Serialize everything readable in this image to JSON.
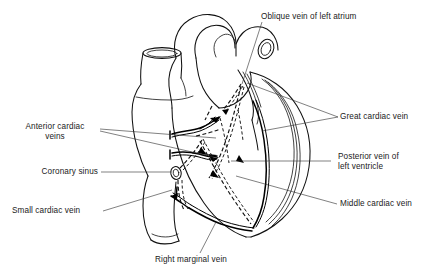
{
  "figure": {
    "background_color": "#ffffff",
    "ink_color": "#111111",
    "label_color": "#1a1a1a",
    "width": 443,
    "height": 274
  },
  "labels": {
    "oblique_vein_left_atrium": "Oblique vein of left atrium",
    "great_cardiac_vein": "Great cardiac vein",
    "anterior_cardiac_veins_line1": "Anterior cardiac",
    "anterior_cardiac_veins_line2": "veins",
    "posterior_vein_left_ventricle_line1": "Posterior vein of",
    "posterior_vein_left_ventricle_line2": "left ventricle",
    "coronary_sinus": "Coronary sinus",
    "middle_cardiac_vein": "Middle cardiac vein",
    "small_cardiac_vein": "Small cardiac vein",
    "right_marginal_vein": "Right marginal vein"
  },
  "structures": {
    "aorta": "aortic-arch",
    "superior_vena_cava": "superior-vena-cava",
    "pulmonary_trunk": "pulmonary-trunk",
    "right_atrium": "right-atrium",
    "right_ventricle": "right-ventricle",
    "left_ventricle": "left-ventricle",
    "inferior_vena_cava": "inferior-vena-cava"
  },
  "vein_styles": {
    "solid_veins": [
      "Anterior cardiac veins",
      "Small cardiac vein",
      "Right marginal vein",
      "Great cardiac vein"
    ],
    "dashed_veins": [
      "Oblique vein of left atrium",
      "Posterior vein of left ventricle",
      "Middle cardiac vein",
      "Coronary sinus"
    ]
  }
}
